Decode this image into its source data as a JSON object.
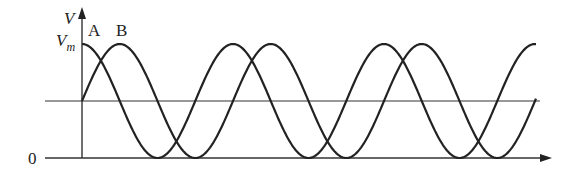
{
  "diagram": {
    "type": "waveform",
    "axes": {
      "y_label": "V",
      "y_max_label": "V",
      "y_max_subscript": "m",
      "origin_label": "0"
    },
    "curves": [
      {
        "name": "A",
        "label": "A",
        "phase": "starts at maximum (cosine)"
      },
      {
        "name": "B",
        "label": "B",
        "phase": "starts at midline rising (sine), lags A by quarter period"
      }
    ],
    "colors": {
      "stroke": "#222222",
      "background": "#ffffff"
    }
  }
}
